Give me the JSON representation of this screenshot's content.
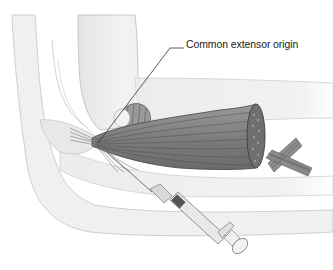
{
  "figure": {
    "annotations": [
      {
        "id": "common-extensor-origin",
        "text": "Common extensor origin"
      }
    ]
  },
  "colors": {
    "background": "#ffffff",
    "bone_fill": "#eeeeee",
    "bone_edge": "#c9c9c9",
    "muscle_fill": "#8a8a8a",
    "muscle_line": "#5a5a5a",
    "leader_line": "#333333",
    "syringe_body": "#e6e6e6",
    "syringe_edge": "#7a7a7a"
  }
}
